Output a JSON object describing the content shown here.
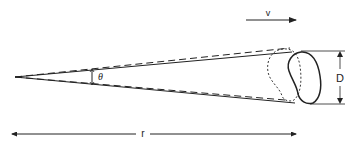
{
  "diagram": {
    "labels": {
      "velocity": "v",
      "diameter": "D",
      "distance": "r",
      "angle": "θ"
    },
    "line_styles": {
      "current_position": "solid",
      "previous_position": "dashed",
      "previous_outline": "dotted"
    },
    "colors": {
      "ink": "#222222",
      "background": "#ffffff"
    }
  }
}
